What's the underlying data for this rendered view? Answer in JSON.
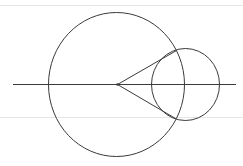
{
  "canvas": {
    "width": 243,
    "height": 166,
    "background": "#ffffff"
  },
  "colors": {
    "stroke": "#3a3a3a",
    "faint_rule": "#e6e6e6"
  },
  "diagram": {
    "type": "geometry",
    "faint_rules": [
      {
        "y": 5,
        "x1": 0,
        "x2": 243
      },
      {
        "y": 117,
        "x1": 0,
        "x2": 243
      }
    ],
    "axis_line": {
      "x1": 13,
      "y1": 84,
      "x2": 236,
      "y2": 84
    },
    "large_circle": {
      "cx": 116,
      "cy": 84,
      "rx": 68,
      "ry": 72
    },
    "small_circle": {
      "cx": 185,
      "cy": 84,
      "rx": 34,
      "ry": 36
    },
    "vertex": {
      "x": 117,
      "y": 84,
      "r": 1.3
    },
    "tangent_lines": [
      {
        "x1": 117,
        "y1": 84,
        "x2": 176,
        "y2": 50
      },
      {
        "x1": 117,
        "y1": 84,
        "x2": 175,
        "y2": 118
      }
    ]
  }
}
